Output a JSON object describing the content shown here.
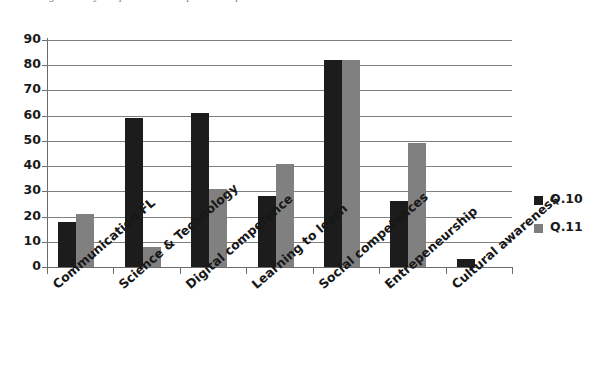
{
  "caption": {
    "text": "Figure 4. Key competences developed and required in the labour market"
  },
  "chart_data": {
    "type": "bar",
    "title": "",
    "xlabel": "",
    "ylabel": "",
    "ylim": [
      0,
      90
    ],
    "ytick_step": 10,
    "ytick_labels": [
      "0",
      "10",
      "20",
      "30",
      "40",
      "50",
      "60",
      "70",
      "80",
      "90"
    ],
    "grid": true,
    "legend_position": "right",
    "categories": [
      "Communication FL",
      "Science & Technology",
      "Digital competence",
      "Learning to learn",
      "Social competences",
      "Entrepeneurship",
      "Cultural awareness"
    ],
    "series": [
      {
        "name": "Q.10",
        "color": "#1c1c1c",
        "values": [
          18,
          59,
          61,
          28,
          82,
          26,
          3
        ]
      },
      {
        "name": "Q.11",
        "color": "#808080",
        "values": [
          21,
          8,
          31,
          41,
          82,
          49,
          0
        ]
      }
    ]
  },
  "legend": {
    "items": [
      {
        "label": "Q.10",
        "color": "#1c1c1c"
      },
      {
        "label": "Q.11",
        "color": "#808080"
      }
    ]
  }
}
